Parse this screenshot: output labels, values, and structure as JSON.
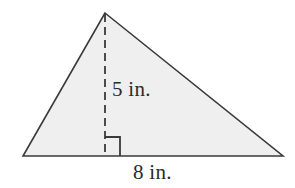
{
  "figure": {
    "name": "triangle-with-height",
    "shape_type": "triangle",
    "fill_color": "#efefef",
    "stroke_color": "#3a3a3a",
    "background_color": "#ffffff",
    "stroke_width": 1.6,
    "vertices": {
      "apex": [
        105,
        13
      ],
      "bottom_left": [
        23,
        156
      ],
      "bottom_right": [
        283,
        156
      ]
    },
    "height_line": {
      "name": "dashed-height-line",
      "from": [
        105,
        13
      ],
      "to": [
        105,
        156
      ],
      "style": "dashed",
      "dash_pattern": "8 5"
    },
    "right_angle_marker": {
      "name": "right-angle-marker",
      "corner": [
        105,
        156
      ],
      "size": 15,
      "orientation": "up-right"
    },
    "labels": {
      "height": "5 in.",
      "base": "8 in."
    }
  },
  "chart_data": {
    "type": "diagram",
    "title": "",
    "shape": "triangle",
    "measurements": [
      {
        "name": "height",
        "value": 5,
        "unit": "in.",
        "label": "5 in."
      },
      {
        "name": "base",
        "value": 8,
        "unit": "in.",
        "label": "8 in."
      }
    ],
    "annotations": [
      "5 in.",
      "8 in."
    ]
  }
}
